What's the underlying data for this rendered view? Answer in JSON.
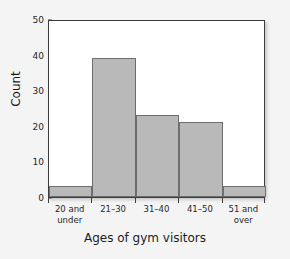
{
  "chart_data": {
    "type": "bar",
    "title": "",
    "subtitle": "",
    "xlabel": "Ages of gym visitors",
    "ylabel": "Count",
    "categories": [
      "20 and under",
      "21–30",
      "31–40",
      "41–50",
      "51 and over"
    ],
    "category_lines": [
      [
        "20 and",
        "under"
      ],
      [
        "21–30",
        ""
      ],
      [
        "31–40",
        ""
      ],
      [
        "41–50",
        ""
      ],
      [
        "51 and",
        "over"
      ]
    ],
    "values": [
      3,
      39,
      23,
      21,
      3
    ],
    "ylim": [
      0,
      50
    ],
    "yticks": [
      0,
      10,
      20,
      30,
      40,
      50
    ],
    "ytick_labels": [
      "0",
      "10",
      "20",
      "30",
      "40",
      "50"
    ],
    "grid": false,
    "legend": false,
    "bar_fill": "#b9b9b9",
    "bar_edge": "#6e6e6e",
    "frame_color": "#3c3c3c",
    "plot_background": "#ffffff",
    "figure_background": "#f4f4f4"
  }
}
